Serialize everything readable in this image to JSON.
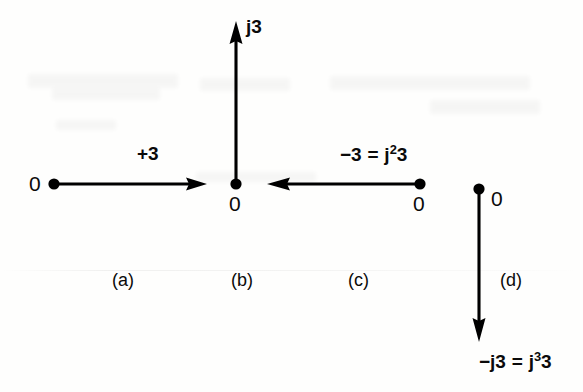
{
  "figure": {
    "caption_panels": [
      "(a)",
      "(b)",
      "(c)",
      "(d)"
    ],
    "ink_color": "#000000",
    "background_color": "#fefefd"
  },
  "panels": {
    "a": {
      "panel_label": "(a)",
      "origin_label": "0",
      "vector_label": "+3",
      "direction": "right",
      "angle_deg": 0
    },
    "b": {
      "panel_label": "(b)",
      "origin_label": "0",
      "vector_label": "j3",
      "direction": "up",
      "angle_deg": 90
    },
    "c": {
      "panel_label": "(c)",
      "origin_label": "0",
      "vector_label_minus": "−3",
      "vector_label_eq": "=",
      "vector_label_j": "j",
      "vector_label_exp": "2",
      "vector_label_mag": "3",
      "vector_label_full": "−3 = j²3",
      "direction": "left",
      "angle_deg": 180
    },
    "d": {
      "panel_label": "(d)",
      "origin_label": "0",
      "vector_label_minus": "−j3",
      "vector_label_eq": "=",
      "vector_label_j": "j",
      "vector_label_exp": "3",
      "vector_label_mag": "3",
      "vector_label_full": "−j3 = j³3",
      "direction": "down",
      "angle_deg": 270
    }
  }
}
